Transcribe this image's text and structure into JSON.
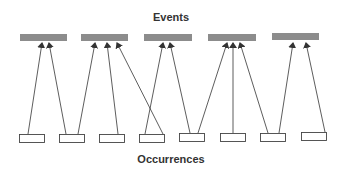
{
  "diagram": {
    "top_label": "Events",
    "bottom_label": "Occurrences",
    "colors": {
      "event_fill": "#8c8c8c",
      "occurrence_stroke": "#444444",
      "arrow": "#333333",
      "text": "#333333"
    },
    "events": [
      {
        "id": "event-1",
        "x": 20,
        "y": 34,
        "w": 47,
        "h": 7
      },
      {
        "id": "event-2",
        "x": 81,
        "y": 34,
        "w": 47,
        "h": 7
      },
      {
        "id": "event-3",
        "x": 144,
        "y": 34,
        "w": 48,
        "h": 7
      },
      {
        "id": "event-4",
        "x": 208,
        "y": 34,
        "w": 48,
        "h": 7
      },
      {
        "id": "event-5",
        "x": 272,
        "y": 33,
        "w": 47,
        "h": 7
      }
    ],
    "occurrences": [
      {
        "id": "occurrence-1",
        "x": 19,
        "y": 134,
        "w": 25,
        "h": 8
      },
      {
        "id": "occurrence-2",
        "x": 59,
        "y": 134,
        "w": 25,
        "h": 8
      },
      {
        "id": "occurrence-3",
        "x": 99,
        "y": 134,
        "w": 25,
        "h": 8
      },
      {
        "id": "occurrence-4",
        "x": 139,
        "y": 134,
        "w": 25,
        "h": 8
      },
      {
        "id": "occurrence-5",
        "x": 179,
        "y": 133,
        "w": 25,
        "h": 8
      },
      {
        "id": "occurrence-6",
        "x": 220,
        "y": 133,
        "w": 25,
        "h": 8
      },
      {
        "id": "occurrence-7",
        "x": 260,
        "y": 133,
        "w": 25,
        "h": 8
      },
      {
        "id": "occurrence-8",
        "x": 301,
        "y": 132,
        "w": 25,
        "h": 8
      }
    ],
    "arrows": [
      {
        "from": "occurrence-1",
        "to": "event-1",
        "x1": 28,
        "y1": 134,
        "x2": 42,
        "y2": 43
      },
      {
        "from": "occurrence-2",
        "to": "event-1",
        "x1": 66,
        "y1": 134,
        "x2": 49,
        "y2": 43
      },
      {
        "from": "occurrence-2",
        "to": "event-2",
        "x1": 78,
        "y1": 134,
        "x2": 95,
        "y2": 43
      },
      {
        "from": "occurrence-3",
        "to": "event-2",
        "x1": 118,
        "y1": 134,
        "x2": 107,
        "y2": 43
      },
      {
        "from": "occurrence-4",
        "to": "event-2",
        "x1": 163,
        "y1": 134,
        "x2": 117,
        "y2": 43
      },
      {
        "from": "occurrence-4",
        "to": "event-3",
        "x1": 145,
        "y1": 134,
        "x2": 163,
        "y2": 43
      },
      {
        "from": "occurrence-5",
        "to": "event-3",
        "x1": 190,
        "y1": 133,
        "x2": 170,
        "y2": 43
      },
      {
        "from": "occurrence-5",
        "to": "event-4",
        "x1": 198,
        "y1": 133,
        "x2": 227,
        "y2": 43
      },
      {
        "from": "occurrence-6",
        "to": "event-4",
        "x1": 233,
        "y1": 133,
        "x2": 233,
        "y2": 43
      },
      {
        "from": "occurrence-7",
        "to": "event-4",
        "x1": 268,
        "y1": 133,
        "x2": 240,
        "y2": 43
      },
      {
        "from": "occurrence-7",
        "to": "event-5",
        "x1": 279,
        "y1": 133,
        "x2": 293,
        "y2": 43
      },
      {
        "from": "occurrence-8",
        "to": "event-5",
        "x1": 325,
        "y1": 132,
        "x2": 306,
        "y2": 43
      }
    ]
  }
}
